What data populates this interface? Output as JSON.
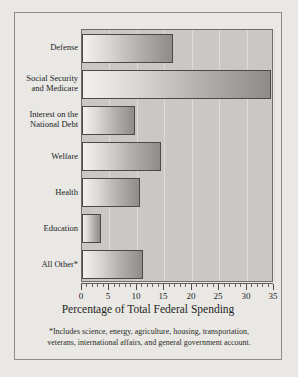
{
  "chart_data": {
    "type": "bar",
    "orientation": "horizontal",
    "title": "",
    "xlabel": "Percentage of Total Federal Spending",
    "ylabel": "",
    "xlim": [
      0,
      35
    ],
    "xticks": [
      0,
      5,
      10,
      15,
      20,
      25,
      30,
      35
    ],
    "xtick_labels": [
      "0",
      "5",
      "10",
      "15",
      "20",
      "25",
      "30",
      "35"
    ],
    "grid": true,
    "grid_axis": "x",
    "legend": false,
    "categories": [
      "Defense",
      "Social Security and Medicare",
      "Interest on the National Debt",
      "Welfare",
      "Health",
      "Education",
      "All Other*"
    ],
    "category_lines": [
      [
        "Defense"
      ],
      [
        "Social Security",
        "and Medicare"
      ],
      [
        "Interest on the",
        "National Debt"
      ],
      [
        "Welfare"
      ],
      [
        "Health"
      ],
      [
        "Education"
      ],
      [
        "All Other*"
      ]
    ],
    "values": [
      16.6,
      34.4,
      9.6,
      14.4,
      10.5,
      3.5,
      11.2
    ],
    "bar_color_start": "#f2f1ee",
    "bar_color_end": "#8d8c89",
    "plot_background": "#c9c8c4",
    "figure_background": "#e9e8e4",
    "gridline_color": "#dddcd8"
  },
  "footnote": {
    "line1": "*Includes science, energy, agriculture, housing, transportation,",
    "line2": "veterans, international affairs, and general government account."
  }
}
